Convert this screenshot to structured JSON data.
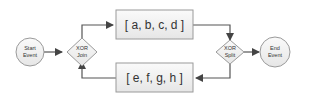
{
  "diagram": {
    "nodes": {
      "start": {
        "label_line1": "Start",
        "label_line2": "Event"
      },
      "xor_join": {
        "label_line1": "XOR",
        "label_line2": "Join"
      },
      "task_top": {
        "label": "[ a, b, c, d ]"
      },
      "task_bottom": {
        "label": "[ e, f, g, h ]"
      },
      "xor_split": {
        "label_line1": "XOR",
        "label_line2": "Split"
      },
      "end": {
        "label_line1": "End",
        "label_line2": "Event"
      }
    },
    "edges": [
      {
        "from": "start",
        "to": "xor_join"
      },
      {
        "from": "xor_join",
        "to": "task_top"
      },
      {
        "from": "task_top",
        "to": "xor_split"
      },
      {
        "from": "xor_split",
        "to": "end"
      },
      {
        "from": "xor_split",
        "to": "task_bottom"
      },
      {
        "from": "task_bottom",
        "to": "xor_join"
      }
    ],
    "colors": {
      "stroke": "#9a9a9a",
      "fill": "#f0f0f0",
      "edge": "#555555"
    }
  }
}
